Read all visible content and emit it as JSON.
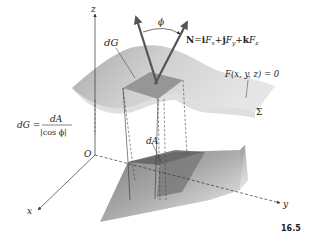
{
  "figure": {
    "number": "16.5",
    "axes": {
      "x": "x",
      "y": "y",
      "z": "z",
      "origin": "O"
    },
    "labels": {
      "dG": "dG",
      "dA": "dA",
      "phi": "ϕ",
      "surface_name": "Σ",
      "surface_equation": "F(x, y, z) = 0",
      "normal_vector": {
        "N": "N",
        "eq": "=",
        "i": "i",
        "Fx": "F",
        "x": "x",
        "plus1": "+",
        "j": "j",
        "Fy": "F",
        "y": "y",
        "plus2": "+",
        "k": "k",
        "Fz": "F",
        "z": "z"
      },
      "formula": {
        "lhs": "dG =",
        "numerator": "dA",
        "denominator": "|cos ϕ|"
      }
    },
    "colors": {
      "surface_light": "#d9d9d9",
      "surface_mid": "#b5b5b5",
      "surface_dark": "#8c8c8c",
      "patch": "#9a9a9a",
      "shadow_patch": "#7a7a7a",
      "lines": "#333333"
    }
  }
}
